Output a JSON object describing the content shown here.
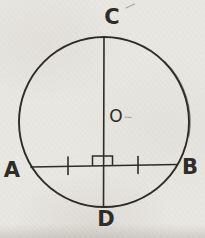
{
  "figure": {
    "labels": {
      "top": "C",
      "bottom": "D",
      "left": "A",
      "right": "B",
      "center": "O"
    },
    "colors": {
      "paper": "#e9e7e2",
      "ink": "#2e2c28"
    },
    "geometry": {
      "circle": {
        "cx": 104,
        "cy": 122,
        "r": 85
      },
      "emphasis_arc": {
        "d": "M 164 61.5 A 85 85 0 0 1 188.3 136.5"
      },
      "diameter_line": {
        "x1": 104,
        "y1": 37,
        "x2": 103.5,
        "y2": 207
      },
      "chord_line": {
        "x1": 31,
        "y1": 167,
        "x2": 177,
        "y2": 164.5
      },
      "tick_marks": [
        {
          "x": 68,
          "y1": 157,
          "y2": 174.5,
          "name": "equal-tick-left"
        },
        {
          "x": 138,
          "y1": 156.5,
          "y2": 173.5,
          "name": "equal-tick-right"
        }
      ],
      "right_angle_mark": {
        "left": 92.5,
        "right": 112.5,
        "top": 156,
        "base_left": 165.9,
        "base_right": 165.5
      },
      "label_positions": {
        "top": {
          "x": 112,
          "y": 17,
          "size": 21,
          "bold": true
        },
        "bottom": {
          "x": 106,
          "y": 219,
          "size": 21,
          "bold": true
        },
        "left": {
          "x": 12,
          "y": 170,
          "size": 21,
          "bold": true
        },
        "right": {
          "x": 190,
          "y": 166.5,
          "size": 21,
          "bold": true
        },
        "center": {
          "x": 116,
          "y": 116,
          "size": 17,
          "bold": false
        }
      },
      "specks": [
        {
          "x1": 126,
          "y1": 8,
          "x2": 134.5,
          "y2": 4
        },
        {
          "x1": 125,
          "y1": 117,
          "x2": 131,
          "y2": 117.5
        }
      ]
    }
  }
}
